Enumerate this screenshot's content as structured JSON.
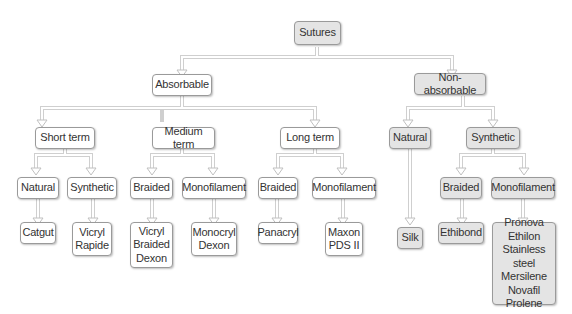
{
  "diagram": {
    "title": "Sutures",
    "colors": {
      "plain_fill": "#ffffff",
      "shaded_fill": "#e4e4e4",
      "border": "#9a9a9a",
      "connector": "#c8c8c8"
    },
    "nodes": {
      "root": "Sutures",
      "absorbable": "Absorbable",
      "nonabsorbable": "Non-absorbable",
      "short_term": "Short term",
      "medium_term": "Medium term",
      "long_term": "Long term",
      "na_natural": "Natural",
      "na_synthetic": "Synthetic",
      "st_natural": "Natural",
      "st_synthetic": "Synthetic",
      "mt_braided": "Braided",
      "mt_monofilament": "Monofilament",
      "lt_braided": "Braided",
      "lt_monofilament": "Monofilament",
      "na_syn_braided": "Braided",
      "na_syn_monofilament": "Monofilament",
      "catgut": "Catgut",
      "vicryl_rapide": "Vicryl\nRapide",
      "vicryl_braided_dexon": "Vicryl\nBraided\nDexon",
      "monocryl_dexon": "Monocryl\nDexon",
      "panacryl": "Panacryl",
      "maxon_pds": "Maxon\nPDS II",
      "silk": "Silk",
      "ethibond": "Ethibond",
      "na_monofilament_list": "Pronova\nEthilon\nStainless steel\nMersilene\nNovafil\nProlene"
    }
  }
}
